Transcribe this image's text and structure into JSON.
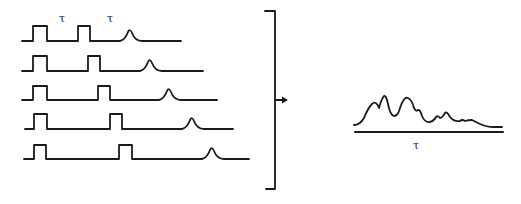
{
  "diagram": {
    "colors": {
      "ink": "#1a1a1a",
      "background": "#ffffff"
    },
    "delay_labels": [
      "τ",
      "τ"
    ],
    "traces": [
      {
        "id": 1,
        "delay_step": 0
      },
      {
        "id": 2,
        "delay_step": 1
      },
      {
        "id": 3,
        "delay_step": 2
      },
      {
        "id": 4,
        "delay_step": 3
      },
      {
        "id": 5,
        "delay_step": 4
      }
    ],
    "bracket": {
      "icon": "bracket-arrow-right"
    },
    "result": {
      "axis_label": "τ",
      "peaks_count": 8
    }
  }
}
